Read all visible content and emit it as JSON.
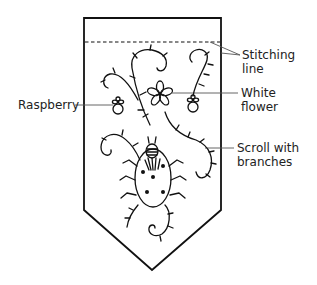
{
  "diagram": {
    "type": "embroidery-pattern",
    "colors": {
      "ink": "#111111",
      "leader": "#555555",
      "background": "#ffffff"
    }
  },
  "labels": {
    "stitching_line": {
      "line1": "Stitching",
      "line2": "line"
    },
    "white_flower": {
      "line1": "White",
      "line2": "flower"
    },
    "raspberry": {
      "line1": "Raspberry"
    },
    "scroll": {
      "line1": "Scroll with",
      "line2": "branches"
    }
  }
}
